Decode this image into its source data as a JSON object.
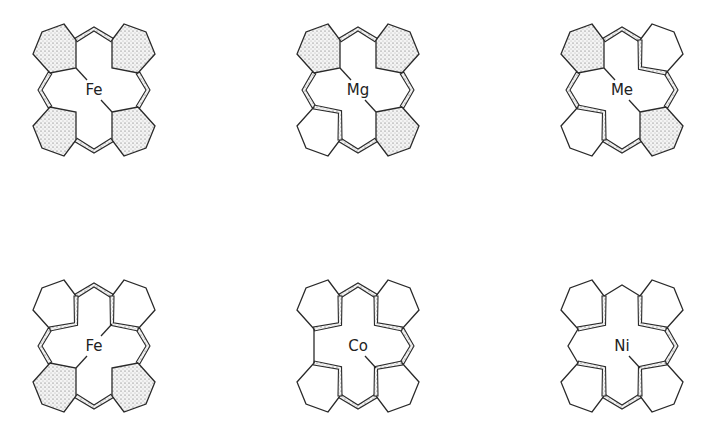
{
  "figure": {
    "type": "porphyrin-macrocycle-comparison",
    "layout": {
      "rows": 2,
      "columns": 3
    },
    "molecules": [
      {
        "id": "m1",
        "metal": "Fe",
        "row": 0,
        "col": 0,
        "x": 28,
        "y": 22,
        "shaded_pentagons": [
          "tl",
          "tr",
          "bl",
          "br"
        ],
        "band": [
          "top",
          "left",
          "right",
          "bottom"
        ],
        "plain_connectors": [],
        "metal_bonds": [
          "tl",
          "br"
        ]
      },
      {
        "id": "m2",
        "metal": "Mg",
        "row": 0,
        "col": 1,
        "x": 292,
        "y": 22,
        "shaded_pentagons": [
          "tl",
          "tr",
          "br"
        ],
        "band": [
          "top",
          "left",
          "right",
          "bottom",
          "bl_inner"
        ],
        "plain_connectors": [],
        "metal_bonds": [
          "tl",
          "br"
        ]
      },
      {
        "id": "m3",
        "metal": "Me",
        "row": 0,
        "col": 2,
        "x": 556,
        "y": 22,
        "shaded_pentagons": [
          "tl",
          "br"
        ],
        "band": [
          "top",
          "left",
          "right",
          "bottom",
          "tr_inner",
          "bl_inner"
        ],
        "plain_connectors": [],
        "metal_bonds": [
          "tl",
          "br"
        ]
      },
      {
        "id": "m4",
        "metal": "Fe",
        "row": 1,
        "col": 0,
        "x": 28,
        "y": 278,
        "shaded_pentagons": [
          "bl",
          "br"
        ],
        "band": [
          "top",
          "left",
          "right",
          "bottom",
          "tl_inner",
          "tr_inner"
        ],
        "plain_connectors": [],
        "metal_bonds": [
          "tr",
          "bl"
        ]
      },
      {
        "id": "m5",
        "metal": "Co",
        "row": 1,
        "col": 1,
        "x": 292,
        "y": 278,
        "shaded_pentagons": [],
        "band": [
          "top",
          "right",
          "bottom",
          "tl_inner",
          "tr_inner",
          "bl_inner",
          "br_inner"
        ],
        "plain_connectors": [
          "left"
        ],
        "metal_bonds": [
          "br"
        ]
      },
      {
        "id": "m6",
        "metal": "Ni",
        "row": 1,
        "col": 2,
        "x": 556,
        "y": 278,
        "shaded_pentagons": [],
        "band": [
          "right",
          "bottom",
          "tl_inner",
          "tr_inner",
          "bl_inner",
          "br_inner"
        ],
        "plain_connectors": [
          "top",
          "left"
        ],
        "metal_bonds": [
          "br"
        ]
      }
    ],
    "labels": [
      "Fe",
      "Mg",
      "Me",
      "Fe",
      "Co",
      "Ni"
    ]
  },
  "colors": {
    "line": "#2a2a2a",
    "background": "#ffffff",
    "stipple": "#555555"
  }
}
